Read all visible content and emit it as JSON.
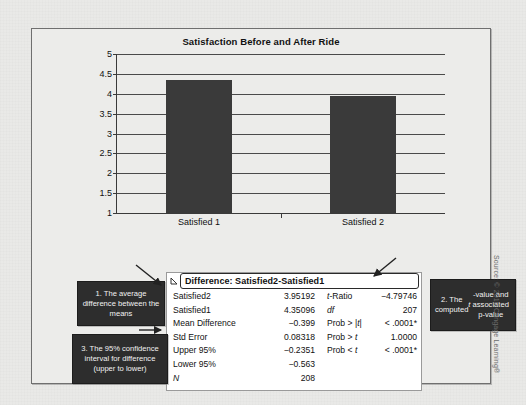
{
  "figure": {
    "source_credit": "Source: © 2010 Cengage Learning®"
  },
  "chart_data": {
    "type": "bar",
    "title": "Satisfaction Before and After Ride",
    "categories": [
      "Satisfied 1",
      "Satisfied 2"
    ],
    "values": [
      4.35096,
      3.95192
    ],
    "xlabel": "",
    "ylabel": "",
    "ylim": [
      1,
      5
    ],
    "ytick_labels": [
      "1",
      "1.5",
      "2",
      "2.5",
      "3",
      "3.5",
      "4",
      "4.5",
      "5"
    ],
    "ytick_values": [
      1,
      1.5,
      2,
      2.5,
      3,
      3.5,
      4,
      4.5,
      5
    ],
    "grid": true,
    "legend": "none",
    "bar_color": "#3a3a3a"
  },
  "stats_panel": {
    "title": "Difference: Satisfied2-Satisfied1",
    "disclosure_icon": "triangle-left-icon",
    "left_rows": [
      {
        "label": "Satisfied2",
        "value": "3.95192"
      },
      {
        "label": "Satisfied1",
        "value": "4.35096"
      },
      {
        "label": "Mean Difference",
        "value": "−0.399"
      },
      {
        "label": "Std Error",
        "value": "0.08318"
      },
      {
        "label": "Upper 95%",
        "value": "−0.2351"
      },
      {
        "label": "Lower 95%",
        "value": "−0.563"
      },
      {
        "label": "N",
        "value": "208",
        "italic_label": true
      }
    ],
    "right_rows": [
      {
        "label": "t-Ratio",
        "value": "−4.79746"
      },
      {
        "label": "df",
        "value": "207"
      },
      {
        "label": "Prob > |t|",
        "value": "< .0001*"
      },
      {
        "label": "Prob > t",
        "value": "1.0000"
      },
      {
        "label": "Prob < t",
        "value": "< .0001*"
      }
    ]
  },
  "callouts": {
    "one": "1. The average difference between the means",
    "two": "2. The computed t-value and associated p-value",
    "three": "3. The 95% confidence interval for difference (upper to lower)"
  }
}
